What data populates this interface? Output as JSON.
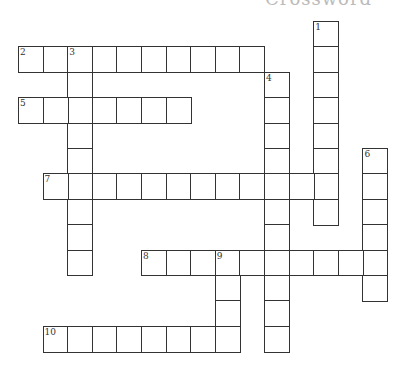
{
  "title": "Crossword",
  "grid": {
    "origin_x": 18,
    "origin_y": 21,
    "cell_w": 24.6,
    "cell_h": 25.4,
    "border_color": "#333333"
  },
  "words": [
    {
      "number": 1,
      "direction": "down",
      "col": 12,
      "row": 0,
      "length": 8
    },
    {
      "number": 2,
      "direction": "across",
      "col": 0,
      "row": 1,
      "length": 10
    },
    {
      "number": 3,
      "direction": "down",
      "col": 2,
      "row": 1,
      "length": 9
    },
    {
      "number": 4,
      "direction": "down",
      "col": 10,
      "row": 2,
      "length": 11
    },
    {
      "number": 5,
      "direction": "across",
      "col": 0,
      "row": 3,
      "length": 7
    },
    {
      "number": 6,
      "direction": "down",
      "col": 14,
      "row": 5,
      "length": 6
    },
    {
      "number": 7,
      "direction": "across",
      "col": 1,
      "row": 6,
      "length": 12
    },
    {
      "number": 8,
      "direction": "across",
      "col": 5,
      "row": 9,
      "length": 10
    },
    {
      "number": 9,
      "direction": "down",
      "col": 8,
      "row": 9,
      "length": 4
    },
    {
      "number": 10,
      "direction": "across",
      "col": 1,
      "row": 12,
      "length": 8
    }
  ]
}
